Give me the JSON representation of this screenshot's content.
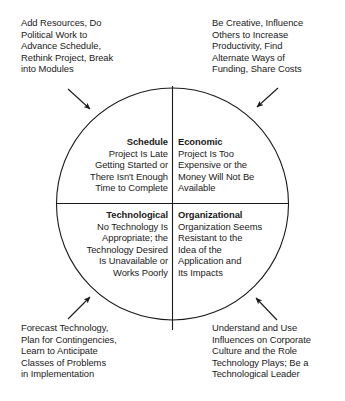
{
  "figure": {
    "type": "quadrant-circle-diagram",
    "line_color": "#1a1a1a",
    "text_color": "#1a1a1a",
    "background": "#ffffff"
  },
  "annotations": {
    "top_left": "Add Resources, Do\nPolitical Work to\nAdvance Schedule,\nRethink Project, Break\ninto Modules",
    "top_right": "Be Creative, Influence\nOthers to Increase\nProductivity, Find\nAlternate Ways of\nFunding, Share Costs",
    "bottom_left": "Forecast Technology,\nPlan for Contingencies,\nLearn to Anticipate\nClasses of Problems\nin Implementation",
    "bottom_right": "Understand and Use\nInfluences on Corporate\nCulture and the Role\nTechnology Plays; Be a\nTechnological Leader"
  },
  "quadrants": {
    "schedule": {
      "heading": "Schedule",
      "body": "Project Is Late\nGetting Started or\nThere Isn't Enough\nTime to Complete"
    },
    "economic": {
      "heading": "Economic",
      "body": "Project Is Too\nExpensive or the\nMoney Will Not Be\nAvailable"
    },
    "technological": {
      "heading": "Technological",
      "body": "No Technology Is\nAppropriate; the\nTechnology Desired\nIs Unavailable or\nWorks Poorly"
    },
    "organizational": {
      "heading": "Organizational",
      "body": "Organization Seems\nResistant to the\nIdea of the\nApplication and\nIts Impacts"
    }
  }
}
